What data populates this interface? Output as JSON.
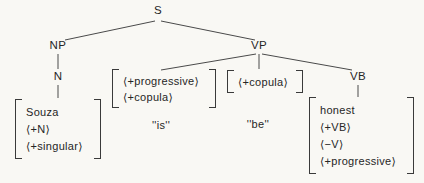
{
  "colors": {
    "background": "#f9f8f4",
    "ink": "#2b2b2b",
    "line": "#4a4a4a"
  },
  "tree": {
    "root_label": "S",
    "np_label": "NP",
    "n_label": "N",
    "vp_label": "VP",
    "vb_label": "VB",
    "np_matrix": [
      "Souza",
      "⟨+N⟩",
      "⟨+singular⟩"
    ],
    "progressive_matrix": [
      "⟨+progressive⟩",
      "⟨+copula⟩"
    ],
    "copula_matrix": [
      "⟨+copula⟩"
    ],
    "vb_matrix": [
      "honest",
      "⟨+VB⟩",
      "⟨−V⟩",
      "⟨+progressive⟩"
    ],
    "word_is": "''is''",
    "word_be": "''be''"
  }
}
